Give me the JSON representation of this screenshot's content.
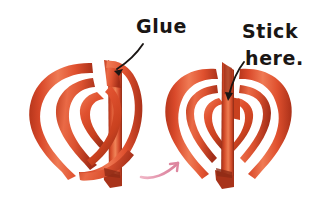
{
  "illustration": {
    "title": "Woven paper heart assembly steps",
    "background_color": "#ffffff",
    "paper": {
      "base_color": "#e0512f",
      "light_color": "#ef7a54",
      "mid_color": "#db4f2d",
      "dark_color": "#b8371c",
      "deep_shadow_color": "#95301a"
    },
    "ink_color": "#1a1614",
    "transition_arrow_color": "#e08fa8"
  },
  "annotations": {
    "glue": {
      "text": "Glue",
      "x": 136,
      "y": 33,
      "font_size": 19
    },
    "stick": {
      "line1": "Stick",
      "line2": "here.",
      "x1": 242,
      "y1": 38,
      "x2": 245,
      "y2": 65,
      "font_size": 19
    }
  },
  "steps": [
    {
      "name": "step-1-unfinished-heart",
      "label": "Glue",
      "state": "loose strip not yet attached"
    },
    {
      "name": "step-2-finished-heart",
      "label": "Stick here.",
      "state": "strip glued down, heart complete"
    }
  ],
  "transition": {
    "name": "progress-arrow",
    "direction": "left-to-right"
  }
}
